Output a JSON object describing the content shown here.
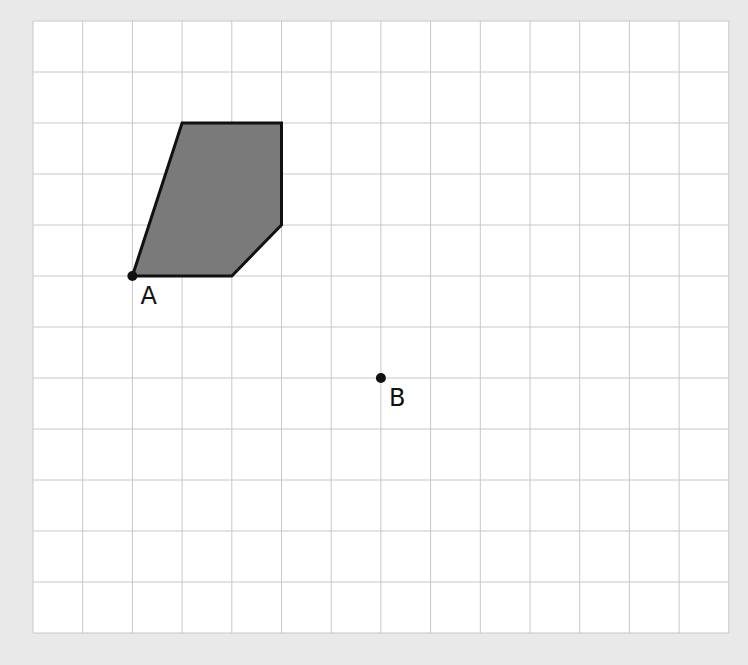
{
  "diagram": {
    "type": "grid-transformation",
    "grid": {
      "columns": 14,
      "rows": 12,
      "origin_px": [
        33,
        21
      ],
      "cell_w": 49.7,
      "cell_h": 51,
      "line_color": "#c8c8c8",
      "background": "#ffffff",
      "page_background": "#e9e9e9"
    },
    "shape": {
      "fill": "#7a7a7a",
      "stroke": "#111111",
      "vertices_grid": [
        [
          2,
          5
        ],
        [
          3,
          2
        ],
        [
          5,
          2
        ],
        [
          5,
          4
        ],
        [
          4,
          5
        ]
      ]
    },
    "points": [
      {
        "id": "A",
        "label": "A",
        "grid": [
          2,
          5
        ],
        "label_offset": [
          8,
          28
        ]
      },
      {
        "id": "B",
        "label": "B",
        "grid": [
          7,
          7
        ],
        "label_offset": [
          8,
          28
        ]
      }
    ]
  }
}
